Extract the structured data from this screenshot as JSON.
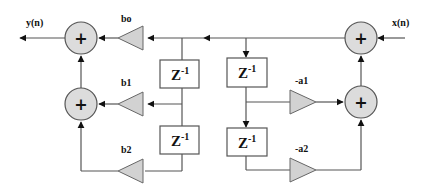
{
  "diagram": {
    "input_label": "x(n)",
    "output_label": "y(n)",
    "adder_symbol": "+",
    "delay_label": "Z",
    "delay_exponent": "-1",
    "feedforward_gains": [
      "bo",
      "b1",
      "b2"
    ],
    "feedback_gains": [
      "-a1",
      "-a2"
    ],
    "colors": {
      "adder_fill": "#dcdcdc",
      "gain_fill": "#d2d2d2",
      "wire": "#555555",
      "arrow": "#111111",
      "background": "#ffffff"
    }
  }
}
